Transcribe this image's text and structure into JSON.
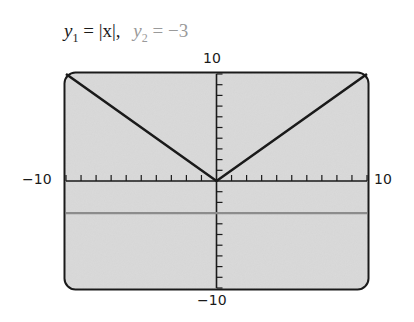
{
  "title": {
    "y1_name": "y",
    "y1_sub": "1",
    "y1_expr": "= |x|,",
    "y2_name": "y",
    "y2_sub": "2",
    "y2_expr": "= −3"
  },
  "axis_labels": {
    "ymax": "10",
    "ymin": "−10",
    "xmin": "−10",
    "xmax": "10"
  },
  "colors": {
    "screen_bg": "#d9d9d9",
    "frame": "#1a1a1a",
    "y1_line": "#1a1a1a",
    "y2_line": "#8c8c8c"
  },
  "chart_data": {
    "type": "line",
    "xlabel": "",
    "ylabel": "",
    "xlim": [
      -10,
      10
    ],
    "ylim": [
      -10,
      10
    ],
    "x_tick_step": 1,
    "y_tick_step": 1,
    "grid": false,
    "series": [
      {
        "name": "y1 = |x|",
        "x": [
          -10,
          0,
          10
        ],
        "values": [
          10,
          0,
          10
        ],
        "color": "#1a1a1a"
      },
      {
        "name": "y2 = -3",
        "x": [
          -10,
          10
        ],
        "values": [
          -3,
          -3
        ],
        "color": "#8c8c8c"
      }
    ]
  }
}
